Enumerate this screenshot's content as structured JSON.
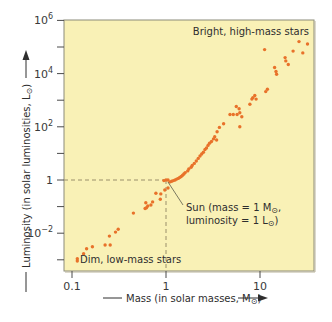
{
  "colors": {
    "plot_bg": "#f9f1b6",
    "frame": "#8c8c7a",
    "point": "#e8722a",
    "guide": "#9a8f6a",
    "text": "#333333"
  },
  "chart_data": {
    "type": "scatter",
    "title": "",
    "xlabel": "Mass (in solar masses, M⊙)",
    "ylabel": "Luminosity (in solar luminosities, L⊙)",
    "xscale": "log",
    "yscale": "log",
    "xlim": [
      0.082,
      37.5
    ],
    "ylim": [
      0.0004,
      1000000
    ],
    "grid": false,
    "legend": null,
    "x_ticks": [
      {
        "value": 0.1,
        "label": "0.1"
      },
      {
        "value": 1,
        "label": "1"
      },
      {
        "value": 10,
        "label": "10"
      }
    ],
    "y_ticks": [
      {
        "value": 1000000,
        "label": "10",
        "exp": "6"
      },
      {
        "value": 100000,
        "label": "",
        "exp": ""
      },
      {
        "value": 10000,
        "label": "10",
        "exp": "4"
      },
      {
        "value": 1000,
        "label": "",
        "exp": ""
      },
      {
        "value": 100,
        "label": "10",
        "exp": "2"
      },
      {
        "value": 10,
        "label": "",
        "exp": ""
      },
      {
        "value": 1,
        "label": "1",
        "exp": ""
      },
      {
        "value": 0.1,
        "label": "",
        "exp": ""
      },
      {
        "value": 0.01,
        "label": "10",
        "exp": "−2"
      },
      {
        "value": 0.001,
        "label": "",
        "exp": ""
      }
    ],
    "reference_point": {
      "name": "Sun",
      "mass": 1,
      "luminosity": 1
    },
    "annotations": [
      {
        "text": "Bright, high-mass stars",
        "position": "top-right"
      },
      {
        "text": "Dim, low-mass stars",
        "position": "bottom-left"
      },
      {
        "text": "Sun (mass = 1 M⊙,",
        "line2": "luminosity = 1 L⊙)",
        "points_to": [
          1,
          1
        ]
      }
    ],
    "points": [
      [
        26.0,
        160000
      ],
      [
        32.0,
        130000
      ],
      [
        28.5,
        60000
      ],
      [
        22.5,
        70000
      ],
      [
        18.5,
        40000
      ],
      [
        18.8,
        30000
      ],
      [
        20.0,
        22000
      ],
      [
        11.2,
        80000
      ],
      [
        14.3,
        17000
      ],
      [
        14.8,
        12000
      ],
      [
        15.0,
        9500
      ],
      [
        12.0,
        2600
      ],
      [
        11.5,
        2100
      ],
      [
        8.8,
        1500
      ],
      [
        8.2,
        1100
      ],
      [
        8.4,
        1250
      ],
      [
        7.8,
        700
      ],
      [
        9.1,
        1100
      ],
      [
        6.0,
        480
      ],
      [
        6.1,
        340
      ],
      [
        6.4,
        240
      ],
      [
        5.7,
        290
      ],
      [
        5.6,
        580
      ],
      [
        4.8,
        290
      ],
      [
        5.2,
        290
      ],
      [
        4.1,
        130
      ],
      [
        6.1,
        100
      ],
      [
        3.7,
        95
      ],
      [
        3.5,
        65
      ],
      [
        3.3,
        42
      ],
      [
        3.45,
        32
      ],
      [
        3.2,
        35
      ],
      [
        3.05,
        28
      ],
      [
        2.9,
        24
      ],
      [
        2.8,
        20
      ],
      [
        2.7,
        16
      ],
      [
        2.6,
        14
      ],
      [
        2.5,
        11
      ],
      [
        2.4,
        9.5
      ],
      [
        2.3,
        8
      ],
      [
        2.2,
        6.5
      ],
      [
        2.1,
        5.2
      ],
      [
        2.0,
        4.2
      ],
      [
        1.9,
        3.5
      ],
      [
        1.85,
        3.0
      ],
      [
        1.75,
        2.6
      ],
      [
        1.7,
        2.2
      ],
      [
        1.6,
        1.9
      ],
      [
        1.55,
        1.7
      ],
      [
        1.5,
        1.5
      ],
      [
        1.45,
        1.35
      ],
      [
        1.4,
        1.25
      ],
      [
        1.35,
        1.15
      ],
      [
        1.3,
        1.08
      ],
      [
        1.25,
        1.0
      ],
      [
        1.2,
        0.95
      ],
      [
        1.15,
        0.9
      ],
      [
        1.1,
        0.85
      ],
      [
        1.05,
        1.0
      ],
      [
        1.0,
        1.0
      ],
      [
        0.95,
        0.95
      ],
      [
        1.05,
        0.5
      ],
      [
        0.97,
        0.42
      ],
      [
        0.88,
        0.3
      ],
      [
        0.78,
        0.32
      ],
      [
        0.87,
        0.19
      ],
      [
        0.72,
        0.15
      ],
      [
        0.69,
        0.115
      ],
      [
        0.64,
        0.105
      ],
      [
        0.62,
        0.09
      ],
      [
        0.6,
        0.085
      ],
      [
        0.61,
        0.14
      ],
      [
        0.45,
        0.057
      ],
      [
        0.31,
        0.014
      ],
      [
        0.29,
        0.011
      ],
      [
        0.25,
        0.0078
      ],
      [
        0.255,
        0.0036
      ],
      [
        0.225,
        0.0036
      ],
      [
        0.165,
        0.0031
      ],
      [
        0.143,
        0.0026
      ],
      [
        0.133,
        0.0017
      ],
      [
        0.114,
        0.0011
      ],
      [
        0.114,
        0.0009
      ]
    ]
  },
  "labels": {
    "bright": "Bright, high-mass stars",
    "dim": "Dim, low-mass stars",
    "sun_line1_pre": "Sun (mass = 1 M",
    "sun_line1_post": ",",
    "sun_line2_pre": "luminosity = 1 L",
    "sun_line2_post": ")",
    "xlabel_pre": "Mass (in solar masses, M",
    "xlabel_post": ")",
    "ylabel_pre": "Luminosity (in solar luminosities, L",
    "ylabel_post": ")",
    "sun_symbol": "⊙"
  }
}
